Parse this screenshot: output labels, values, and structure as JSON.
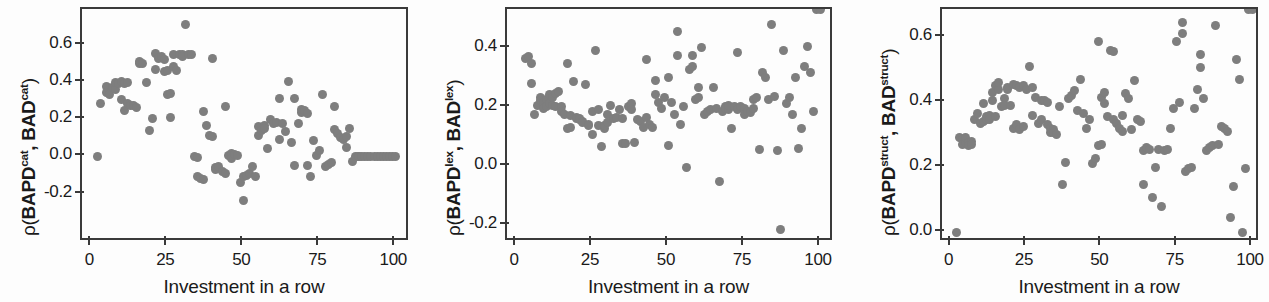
{
  "figure": {
    "panel_count": 3,
    "marker_color": "#7e7e7e",
    "axis_color": "#3a3a3a",
    "background": "#fdfdfd"
  },
  "chart_data": [
    {
      "type": "scatter",
      "title": "",
      "xlabel": "Investment in a row",
      "ylabel": "ρ(BAPDᶜᵃᵗ, BADᶜᵃᵗ)",
      "ylabel_parts": {
        "prefix": "ρ(BAPD",
        "sup1": "cat",
        "mid": ", BAD",
        "sup2": "cat",
        "suffix": ")"
      },
      "xlim": [
        -3,
        104
      ],
      "ylim": [
        -0.27,
        0.75
      ],
      "xticks": [
        0,
        25,
        50,
        75,
        100
      ],
      "xticklabels": [
        "0",
        "25",
        "50",
        "75",
        "100"
      ],
      "yticks": [
        -0.2,
        0.0,
        0.2,
        0.4,
        0.6
      ],
      "yticklabels": [
        "-0.2",
        "0.0",
        "0.2",
        "0.4",
        "0.6"
      ],
      "grid": false,
      "legend": null,
      "x": [
        2,
        3,
        5,
        5,
        6,
        7,
        8,
        8,
        9,
        10,
        10,
        11,
        11,
        12,
        12,
        13,
        14,
        15,
        16,
        16,
        17,
        18,
        19,
        20,
        21,
        21,
        22,
        23,
        24,
        24,
        25,
        25,
        26,
        26,
        27,
        27,
        28,
        29,
        30,
        30,
        31,
        32,
        33,
        34,
        35,
        35,
        36,
        37,
        37,
        38,
        39,
        40,
        40,
        41,
        41,
        42,
        43,
        44,
        44,
        45,
        46,
        46,
        47,
        48,
        49,
        50,
        50,
        51,
        52,
        53,
        54,
        55,
        55,
        56,
        57,
        57,
        58,
        59,
        60,
        61,
        62,
        62,
        63,
        64,
        65,
        66,
        67,
        67,
        68,
        69,
        69,
        70,
        71,
        71,
        72,
        73,
        74,
        75,
        76,
        77,
        78,
        79,
        80,
        80,
        81,
        82,
        83,
        84,
        84,
        85,
        86,
        87,
        88,
        88,
        89,
        90,
        91,
        92,
        93,
        94,
        95,
        96,
        97,
        98,
        99,
        100
      ],
      "y": [
        0.0,
        0.285,
        0.375,
        0.345,
        0.335,
        0.37,
        0.36,
        0.395,
        0.39,
        0.4,
        0.305,
        0.245,
        0.39,
        0.395,
        0.285,
        0.275,
        0.275,
        0.265,
        0.5,
        0.51,
        0.5,
        0.395,
        0.14,
        0.205,
        0.555,
        0.465,
        0.525,
        0.535,
        0.52,
        0.455,
        0.46,
        0.33,
        0.34,
        0.21,
        0.485,
        0.545,
        0.46,
        0.545,
        0.55,
        0.535,
        0.71,
        0.545,
        0.545,
        0.0,
        -0.005,
        -0.11,
        -0.12,
        -0.125,
        0.24,
        0.165,
        0.115,
        0.525,
        0.105,
        -0.06,
        -0.07,
        -0.055,
        -0.08,
        -0.09,
        0.27,
        0.005,
        0.015,
        -0.01,
        0.01,
        0.005,
        -0.14,
        -0.235,
        -0.11,
        -0.1,
        -0.09,
        -0.055,
        -0.11,
        0.16,
        0.115,
        0.14,
        0.165,
        0.15,
        0.045,
        0.2,
        0.175,
        0.18,
        0.31,
        0.09,
        0.175,
        0.135,
        0.405,
        0.075,
        -0.05,
        0.31,
        0.175,
        0.235,
        0.25,
        0.245,
        0.23,
        -0.05,
        -0.11,
        0.085,
        0.005,
        0.03,
        0.335,
        -0.055,
        -0.045,
        -0.035,
        0.27,
        0.145,
        0.125,
        0.1,
        0.09,
        0.105,
        0.05,
        0.15,
        -0.025,
        0.0,
        0.0,
        0.0,
        0.0,
        0.0,
        0.0,
        0.0,
        0.0,
        0.0,
        0.0,
        0.0,
        0.0,
        0.0,
        0.0,
        0.0,
        0.0,
        0.0
      ]
    },
    {
      "type": "scatter",
      "title": "",
      "xlabel": "Investment in a row",
      "ylabel": "ρ(BAPDˡᵉˣ, BADˡᵉˣ)",
      "ylabel_parts": {
        "prefix": "ρ(BAPD",
        "sup1": "lex",
        "mid": ", BAD",
        "sup2": "lex",
        "suffix": ")"
      },
      "xlim": [
        -3,
        104
      ],
      "ylim": [
        -0.25,
        0.5
      ],
      "xticks": [
        0,
        25,
        50,
        75,
        100
      ],
      "xticklabels": [
        "0",
        "25",
        "50",
        "75",
        "100"
      ],
      "yticks": [
        -0.2,
        0.0,
        0.2,
        0.4
      ],
      "yticklabels": [
        "-0.2",
        "0.0",
        "0.2",
        "0.4"
      ],
      "grid": false,
      "legend": null,
      "x": [
        3,
        4,
        5,
        5,
        6,
        7,
        8,
        8,
        9,
        9,
        10,
        10,
        11,
        11,
        12,
        12,
        13,
        13,
        14,
        15,
        15,
        16,
        17,
        17,
        18,
        18,
        19,
        20,
        20,
        21,
        21,
        22,
        22,
        23,
        24,
        24,
        25,
        25,
        26,
        27,
        27,
        28,
        29,
        29,
        30,
        30,
        31,
        32,
        33,
        34,
        35,
        35,
        36,
        37,
        38,
        38,
        39,
        40,
        41,
        42,
        43,
        43,
        44,
        45,
        46,
        46,
        47,
        48,
        49,
        50,
        50,
        51,
        52,
        53,
        53,
        54,
        55,
        56,
        57,
        58,
        58,
        59,
        60,
        60,
        61,
        62,
        63,
        64,
        65,
        66,
        67,
        68,
        69,
        69,
        70,
        70,
        71,
        72,
        73,
        73,
        74,
        75,
        75,
        76,
        77,
        78,
        78,
        79,
        80,
        81,
        82,
        83,
        84,
        85,
        86,
        87,
        88,
        89,
        90,
        91,
        92,
        93,
        94,
        95,
        96,
        97,
        98,
        99,
        100
      ],
      "y": [
        0.365,
        0.37,
        0.345,
        0.28,
        0.175,
        0.205,
        0.23,
        0.22,
        0.215,
        0.195,
        0.225,
        0.2,
        0.24,
        0.21,
        0.23,
        0.205,
        0.2,
        0.245,
        0.25,
        0.2,
        0.185,
        0.175,
        0.345,
        0.125,
        0.13,
        0.17,
        0.285,
        0.165,
        0.16,
        0.155,
        0.16,
        0.15,
        0.145,
        0.275,
        0.14,
        0.135,
        0.185,
        0.105,
        0.39,
        0.19,
        0.135,
        0.065,
        0.125,
        0.135,
        0.175,
        0.145,
        0.205,
        0.16,
        0.165,
        0.19,
        0.075,
        0.16,
        0.075,
        0.2,
        0.21,
        0.19,
        0.08,
        0.155,
        0.15,
        0.13,
        0.36,
        0.165,
        0.14,
        0.13,
        0.29,
        0.24,
        0.215,
        0.195,
        0.23,
        0.3,
        0.07,
        0.215,
        0.175,
        0.455,
        0.375,
        0.14,
        0.2,
        -0.005,
        0.325,
        0.335,
        0.375,
        0.225,
        0.23,
        0.265,
        0.4,
        0.175,
        0.185,
        0.19,
        0.265,
        0.195,
        -0.055,
        0.185,
        0.2,
        0.195,
        0.19,
        0.205,
        0.125,
        0.2,
        0.385,
        0.19,
        0.2,
        0.195,
        0.175,
        0.185,
        0.18,
        0.225,
        0.195,
        0.23,
        0.055,
        0.315,
        0.3,
        0.225,
        0.48,
        0.235,
        0.05,
        -0.215,
        0.39,
        0.21,
        0.23,
        0.175,
        0.3,
        0.06,
        0.125,
        0.335,
        0.405,
        0.315,
        0.185
      ]
    },
    {
      "type": "scatter",
      "title": "",
      "xlabel": "Investment in a row",
      "ylabel": "ρ(BAPDˢᵗʳᵘᶜᵗ, BADˢᵗʳᵘᶜᵗ)",
      "ylabel_parts": {
        "prefix": "ρ(BAPD",
        "sup1": "struct",
        "mid": ", BAD",
        "sup2": "struct",
        "suffix": ")"
      },
      "xlim": [
        -3,
        104
      ],
      "ylim": [
        -0.03,
        0.68
      ],
      "xticks": [
        0,
        25,
        50,
        75,
        100
      ],
      "xticklabels": [
        "0",
        "25",
        "50",
        "75",
        "100"
      ],
      "yticks": [
        0.0,
        0.2,
        0.4,
        0.6
      ],
      "yticklabels": [
        "0.0",
        "0.2",
        "0.4",
        "0.6"
      ],
      "grid": false,
      "legend": null,
      "x": [
        2,
        3,
        4,
        4,
        5,
        5,
        6,
        6,
        7,
        7,
        8,
        9,
        10,
        11,
        11,
        12,
        12,
        13,
        13,
        14,
        14,
        15,
        15,
        16,
        16,
        17,
        18,
        18,
        19,
        19,
        20,
        21,
        21,
        22,
        22,
        23,
        23,
        24,
        24,
        25,
        26,
        27,
        27,
        28,
        29,
        30,
        30,
        31,
        32,
        32,
        33,
        33,
        34,
        34,
        35,
        36,
        37,
        38,
        39,
        40,
        41,
        42,
        43,
        44,
        45,
        46,
        47,
        48,
        49,
        49,
        50,
        50,
        51,
        51,
        52,
        53,
        54,
        54,
        55,
        56,
        57,
        57,
        58,
        59,
        60,
        61,
        62,
        63,
        64,
        64,
        65,
        66,
        67,
        68,
        69,
        70,
        71,
        72,
        73,
        74,
        75,
        76,
        77,
        77,
        78,
        79,
        80,
        81,
        82,
        83,
        83,
        84,
        85,
        86,
        87,
        88,
        89,
        90,
        91,
        92,
        93,
        94,
        95,
        96,
        97,
        98,
        99,
        100
      ],
      "y": [
        0.0,
        0.29,
        0.285,
        0.27,
        0.275,
        0.29,
        0.275,
        0.265,
        0.28,
        0.27,
        0.345,
        0.365,
        0.335,
        0.395,
        0.34,
        0.345,
        0.355,
        0.36,
        0.345,
        0.43,
        0.405,
        0.45,
        0.355,
        0.44,
        0.46,
        0.385,
        0.41,
        0.39,
        0.445,
        0.44,
        0.39,
        0.455,
        0.32,
        0.45,
        0.33,
        0.445,
        0.315,
        0.45,
        0.325,
        0.44,
        0.51,
        0.36,
        0.445,
        0.415,
        0.335,
        0.405,
        0.345,
        0.405,
        0.4,
        0.33,
        0.305,
        0.32,
        0.315,
        0.305,
        0.3,
        0.385,
        0.145,
        0.215,
        0.41,
        0.42,
        0.435,
        0.375,
        0.47,
        0.365,
        0.32,
        0.345,
        0.21,
        0.225,
        0.585,
        0.265,
        0.27,
        0.415,
        0.43,
        0.395,
        0.355,
        0.56,
        0.555,
        0.345,
        0.335,
        0.32,
        0.36,
        0.31,
        0.425,
        0.41,
        0.315,
        0.465,
        0.345,
        0.34,
        0.145,
        0.25,
        0.26,
        0.255,
        0.105,
        0.2,
        0.255,
        0.08,
        0.25,
        0.255,
        0.32,
        0.38,
        0.585,
        0.4,
        0.645,
        0.61,
        0.185,
        0.195,
        0.2,
        0.38,
        0.44,
        0.545,
        0.505,
        0.41,
        0.25,
        0.26,
        0.265,
        0.635,
        0.27,
        0.325,
        0.32,
        0.31,
        0.045,
        0.14,
        0.53,
        0.47,
        0.0,
        0.195
      ]
    }
  ]
}
